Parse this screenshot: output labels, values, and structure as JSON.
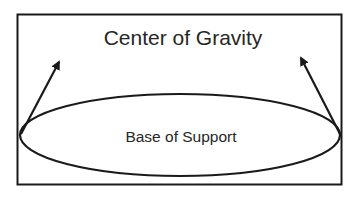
{
  "diagram": {
    "title": "Center of Gravity",
    "base_label": "Base of Support",
    "colors": {
      "stroke": "#1a1a1a",
      "text": "#262626",
      "background": "#ffffff"
    },
    "elements": {
      "frame": {
        "shape": "rectangle"
      },
      "base": {
        "shape": "ellipse"
      },
      "left_arrow": {
        "direction": "up-right"
      },
      "right_arrow": {
        "direction": "up-left"
      }
    }
  }
}
